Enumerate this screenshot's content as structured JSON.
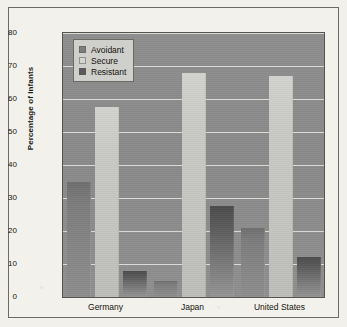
{
  "chart_data": {
    "type": "bar",
    "title": "",
    "xlabel": "",
    "ylabel": "Percentage of Infants",
    "ylim": [
      0,
      80
    ],
    "yticks": [
      0,
      10,
      20,
      30,
      40,
      50,
      60,
      70,
      80
    ],
    "ytick_labels": [
      "0",
      "10",
      "20",
      "30",
      "40",
      "50",
      "60",
      "70",
      "80"
    ],
    "grid": true,
    "legend_position": "upper-left-inside",
    "categories": [
      "Germany",
      "Japan",
      "United States"
    ],
    "series": [
      {
        "name": "Avoidant",
        "color": "#7e7e7e",
        "values": [
          35,
          5,
          21
        ]
      },
      {
        "name": "Secure",
        "color": "#d4d4d1",
        "values": [
          57.5,
          68,
          67
        ]
      },
      {
        "name": "Resistant",
        "color": "#5a5a5a",
        "values": [
          8,
          27.5,
          12
        ]
      }
    ]
  },
  "legend": {
    "items": [
      {
        "label": "Avoidant"
      },
      {
        "label": "Secure"
      },
      {
        "label": "Resistant"
      }
    ]
  },
  "colors": {
    "plot_background": "#8c8c8c",
    "page_background": "#f2f0ea",
    "gridline": "#e3e2de",
    "axis_text": "#15140f",
    "frame_border": "#6d6a64"
  }
}
